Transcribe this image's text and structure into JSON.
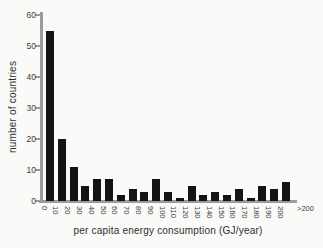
{
  "colors": {
    "bar": "#141414",
    "axis": "#9b9b9b",
    "text": "#3a3a3a",
    "background": "#fafaf9"
  },
  "chart_data": {
    "type": "bar",
    "title": "",
    "xlabel": "per capita energy consumption (GJ/year)",
    "ylabel": "number of countries",
    "categories": [
      "0-10",
      "10-20",
      "20-30",
      "30-40",
      "40-50",
      "50-60",
      "60-70",
      "70-80",
      "80-90",
      "90-100",
      "100-110",
      "110-120",
      "120-130",
      "130-140",
      "140-150",
      "150-160",
      "160-170",
      "170-180",
      "180-190",
      "190-200",
      ">200"
    ],
    "values": [
      55,
      20,
      11,
      5,
      7,
      7,
      2,
      4,
      3,
      7,
      3,
      1,
      5,
      2,
      3,
      2,
      4,
      1,
      5,
      4,
      6
    ],
    "bin_edge_labels": [
      "0",
      "10",
      "20",
      "30",
      "40",
      "50",
      "60",
      "70",
      "80",
      "90",
      "100",
      "110",
      "120",
      "130",
      "140",
      "150",
      "160",
      "170",
      "180",
      "190",
      "200"
    ],
    "overflow_label": ">200",
    "yticks": [
      0,
      10,
      20,
      30,
      40,
      50,
      60
    ],
    "ylim": [
      0,
      60
    ],
    "grid": false,
    "legend_position": "none"
  }
}
